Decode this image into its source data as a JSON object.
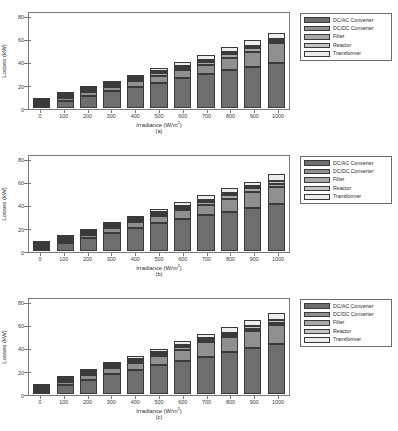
{
  "figure": {
    "panels": [
      {
        "caption": "(a)",
        "xlabel_main": "Irradiance (W/m",
        "xlabel_sup": "2",
        "xlabel_tail": ")",
        "ylabel": "Losses (kW)"
      },
      {
        "caption": "(b)",
        "xlabel_main": "Irradiance (W/m",
        "xlabel_sup": "2",
        "xlabel_tail": ")",
        "ylabel": "Losses (kW)"
      },
      {
        "caption": "(c)",
        "xlabel_main": "Irradiance (W/m",
        "xlabel_sup": "2",
        "xlabel_tail": ")",
        "ylabel": "Losses (kW)"
      }
    ]
  },
  "legend": {
    "items": [
      {
        "label": "DC/AC Converter",
        "color": "#6e6e6e"
      },
      {
        "label": "DC/DC Converter",
        "color": "#909090"
      },
      {
        "label": "Filter",
        "color": "#a8a8a8"
      },
      {
        "label": "Reactor",
        "color": "#c4c4c4"
      },
      {
        "label": "Transformer",
        "color": "#ededed"
      }
    ]
  },
  "chart_data": [
    {
      "type": "bar",
      "stacked": true,
      "title": "(a)",
      "xlabel": "Irradiance (W/m2)",
      "ylabel": "Losses (kW)",
      "ylim": [
        0,
        85
      ],
      "yticks": [
        0,
        20,
        40,
        60,
        80
      ],
      "grid": false,
      "legend_position": "right",
      "categories": [
        "0",
        "100",
        "200",
        "300",
        "400",
        "500",
        "600",
        "700",
        "800",
        "900",
        "1000"
      ],
      "series": [
        {
          "name": "DC/AC Converter",
          "color": "#6e6e6e",
          "values": [
            6.6,
            9.6,
            13.6,
            16.9,
            20.4,
            23.4,
            27.0,
            30.5,
            34.6,
            37.4,
            40.8
          ]
        },
        {
          "name": "DC/DC Converter",
          "color": "#909090",
          "values": [
            0.6,
            2.4,
            3.6,
            4.4,
            5.2,
            6.4,
            7.4,
            8.6,
            11.0,
            13.6,
            18.0
          ]
        },
        {
          "name": "Filter",
          "color": "#a8a8a8",
          "values": [
            0.3,
            0.7,
            0.9,
            1.1,
            1.4,
            2.3,
            2.6,
            2.8,
            3.0,
            3.2,
            1.6
          ]
        },
        {
          "name": "Reactor",
          "color": "#c4c4c4",
          "values": [
            0.3,
            0.5,
            0.5,
            0.7,
            1.0,
            1.2,
            1.4,
            1.6,
            1.8,
            2.0,
            2.2
          ]
        },
        {
          "name": "Transformer",
          "color": "#ededed",
          "values": [
            0.4,
            1.1,
            1.3,
            1.6,
            2.0,
            2.6,
            3.5,
            4.1,
            4.9,
            5.2,
            5.6
          ]
        }
      ],
      "totals": [
        8.2,
        14.3,
        19.9,
        24.7,
        30.0,
        35.9,
        41.9,
        47.6,
        55.3,
        61.4,
        68.2
      ]
    },
    {
      "type": "bar",
      "stacked": true,
      "title": "(b)",
      "xlabel": "Irradiance (W/m2)",
      "ylabel": "Losses (kW)",
      "ylim": [
        0,
        85
      ],
      "yticks": [
        0,
        20,
        40,
        60,
        80
      ],
      "grid": false,
      "legend_position": "right",
      "categories": [
        "0",
        "100",
        "200",
        "300",
        "400",
        "500",
        "600",
        "700",
        "800",
        "900",
        "1000"
      ],
      "series": [
        {
          "name": "DC/AC Converter",
          "color": "#6e6e6e",
          "values": [
            6.3,
            9.9,
            14.0,
            17.6,
            21.3,
            25.4,
            28.8,
            32.3,
            35.6,
            39.0,
            42.6
          ]
        },
        {
          "name": "DC/DC Converter",
          "color": "#909090",
          "values": [
            0.5,
            2.3,
            3.5,
            4.6,
            5.8,
            6.9,
            8.2,
            9.4,
            11.8,
            14.5,
            15.6
          ]
        },
        {
          "name": "Filter",
          "color": "#a8a8a8",
          "values": [
            0.3,
            0.7,
            0.9,
            1.2,
            1.6,
            2.0,
            2.5,
            2.9,
            3.2,
            3.4,
            2.5
          ]
        },
        {
          "name": "Reactor",
          "color": "#c4c4c4",
          "values": [
            0.3,
            0.5,
            0.6,
            0.8,
            1.0,
            1.2,
            1.5,
            1.7,
            1.9,
            2.1,
            2.3
          ]
        },
        {
          "name": "Transformer",
          "color": "#ededed",
          "values": [
            0.4,
            1.0,
            1.3,
            1.7,
            2.2,
            2.6,
            3.2,
            4.0,
            4.1,
            3.8,
            6.4
          ]
        }
      ],
      "totals": [
        7.8,
        14.4,
        20.3,
        25.9,
        31.9,
        38.1,
        44.2,
        50.3,
        56.6,
        62.8,
        69.4
      ]
    },
    {
      "type": "bar",
      "stacked": true,
      "title": "(c)",
      "xlabel": "Irradiance (W/m2)",
      "ylabel": "Losses (kW)",
      "ylim": [
        0,
        85
      ],
      "yticks": [
        0,
        20,
        40,
        60,
        80
      ],
      "grid": false,
      "legend_position": "right",
      "categories": [
        "0",
        "100",
        "200",
        "300",
        "400",
        "500",
        "600",
        "700",
        "800",
        "900",
        "1000"
      ],
      "series": [
        {
          "name": "DC/AC Converter",
          "color": "#6e6e6e",
          "values": [
            6.6,
            10.8,
            15.1,
            19.0,
            22.4,
            26.3,
            30.0,
            33.8,
            37.8,
            41.6,
            45.2
          ]
        },
        {
          "name": "DC/DC Converter",
          "color": "#909090",
          "values": [
            0.6,
            3.4,
            4.4,
            5.6,
            7.0,
            8.5,
            10.3,
            13.0,
            13.8,
            15.2,
            16.8
          ]
        },
        {
          "name": "Filter",
          "color": "#a8a8a8",
          "values": [
            0.3,
            0.8,
            1.0,
            1.3,
            1.6,
            2.0,
            2.4,
            1.6,
            1.8,
            2.0,
            2.2
          ]
        },
        {
          "name": "Reactor",
          "color": "#c4c4c4",
          "values": [
            0.3,
            0.5,
            0.6,
            0.8,
            1.0,
            1.3,
            1.5,
            1.8,
            2.0,
            2.3,
            2.5
          ]
        },
        {
          "name": "Transformer",
          "color": "#ededed",
          "values": [
            0.4,
            1.2,
            1.4,
            1.8,
            2.3,
            2.9,
            3.3,
            3.9,
            4.8,
            5.8,
            7.0
          ]
        }
      ],
      "totals": [
        8.2,
        16.7,
        22.5,
        28.5,
        34.3,
        41.0,
        47.5,
        54.1,
        60.2,
        66.9,
        73.7
      ]
    }
  ]
}
